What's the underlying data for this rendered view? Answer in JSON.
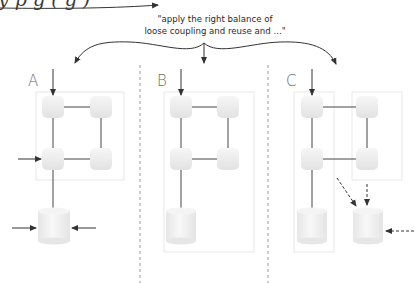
{
  "header": {
    "cropped_text": "y   p     g     (  g         )"
  },
  "quote": {
    "line1": "\"apply the right balance of",
    "line2": "loose coupling and reuse and ...\""
  },
  "panels": [
    {
      "label": "A",
      "description": "services share one database; database accessed from outside"
    },
    {
      "label": "B",
      "description": "services share one encapsulated database"
    },
    {
      "label": "C",
      "description": "services each encapsulated, second database with optional dashed access"
    }
  ],
  "colors": {
    "node_fill": "#eeeeee",
    "line": "#444444",
    "divider": "#9a9a9a",
    "frame": "#e4e4e4"
  }
}
